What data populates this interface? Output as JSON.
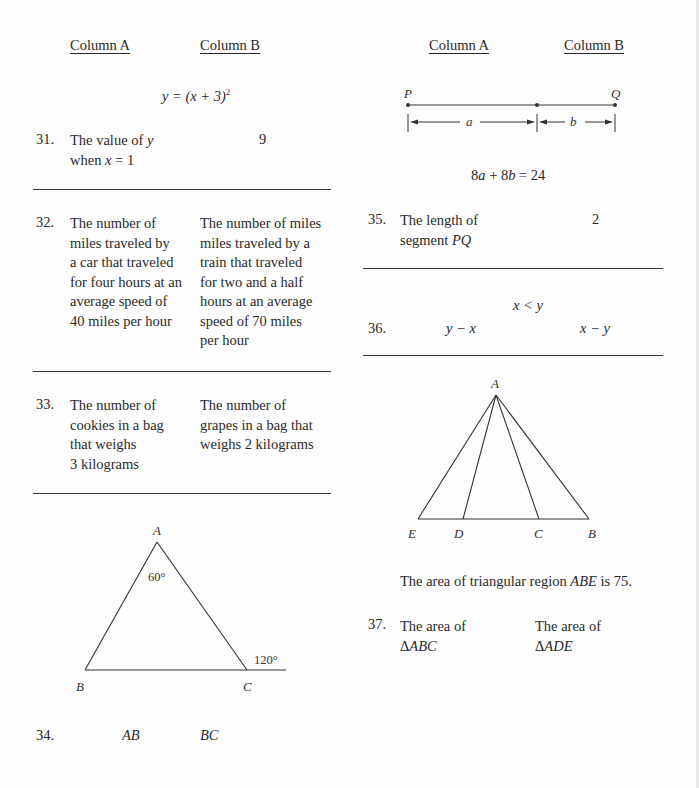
{
  "left_column": {
    "headers": {
      "column_a": "Column A",
      "column_b": "Column B"
    },
    "q31": {
      "given": "y = (x + 3)²",
      "number": "31.",
      "column_a": [
        "The value of y",
        "when x = 1"
      ],
      "column_b": "9"
    },
    "q32": {
      "number": "32.",
      "column_a": [
        "The number of",
        "miles traveled by",
        "a car that traveled",
        "for four hours at an",
        "average speed of",
        "40 miles per hour"
      ],
      "column_b": [
        "The number of miles",
        "miles traveled by a",
        "train that traveled",
        "for two and a half",
        "hours at an average",
        "speed of 70 miles",
        "per hour"
      ]
    },
    "q33": {
      "number": "33.",
      "column_a": [
        "The number of",
        "cookies in a bag",
        "that weighs",
        "3 kilograms"
      ],
      "column_b": [
        "The number of",
        "grapes in a bag that",
        "weighs 2 kilograms"
      ]
    },
    "q34": {
      "figure": {
        "vertex_a": "A",
        "vertex_b": "B",
        "vertex_c": "C",
        "angle_a": "60°",
        "exterior_angle_c": "120°"
      },
      "number": "34.",
      "column_a": "AB",
      "column_b": "BC"
    }
  },
  "right_column": {
    "headers": {
      "column_a": "Column A",
      "column_b": "Column B"
    },
    "q35": {
      "figure": {
        "point_p": "P",
        "point_q": "Q",
        "segment_a": "a",
        "segment_b": "b"
      },
      "given": "8a + 8b = 24",
      "number": "35.",
      "column_a": [
        "The length of",
        "segment PQ"
      ],
      "column_b": "2"
    },
    "q36": {
      "given": "x < y",
      "number": "36.",
      "column_a": "y − x",
      "column_b": "x − y"
    },
    "q37": {
      "figure": {
        "vertex_a": "A",
        "vertex_e": "E",
        "vertex_d": "D",
        "vertex_c": "C",
        "vertex_b": "B"
      },
      "given": "The area of triangular region ABE is 75.",
      "number": "37.",
      "column_a": [
        "The area of",
        "ΔABC"
      ],
      "column_b": [
        "The area of",
        "ΔADE"
      ]
    }
  }
}
